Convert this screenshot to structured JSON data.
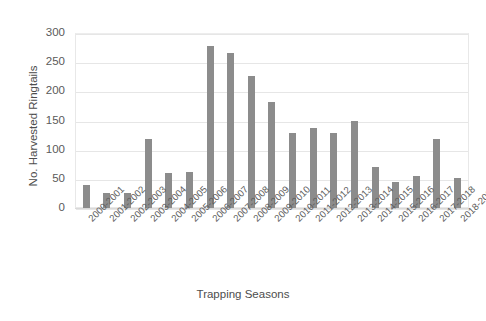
{
  "chart_data": {
    "type": "bar",
    "title": "",
    "xlabel": "Trapping Seasons",
    "ylabel": "No. Harvested Ringtails",
    "ylim": [
      0,
      300
    ],
    "yticks": [
      0,
      50,
      100,
      150,
      200,
      250,
      300
    ],
    "grid": true,
    "legend": false,
    "bar_color": "#8c8c8c",
    "categories": [
      "2000-2001",
      "2001-2002",
      "2002-2003",
      "2003-2004",
      "2004-2005",
      "2005-2006",
      "2006-2007",
      "2007-2008",
      "2008-2009",
      "2009-2010",
      "2010-2011",
      "2011-2012",
      "2012-2013",
      "2013-2014",
      "2014-2015",
      "2015-2016",
      "2016-2017",
      "2017-2018",
      "2018-2019"
    ],
    "values": [
      40,
      26,
      26,
      118,
      60,
      62,
      278,
      265,
      226,
      181,
      128,
      137,
      128,
      150,
      70,
      45,
      55,
      118,
      51
    ]
  }
}
